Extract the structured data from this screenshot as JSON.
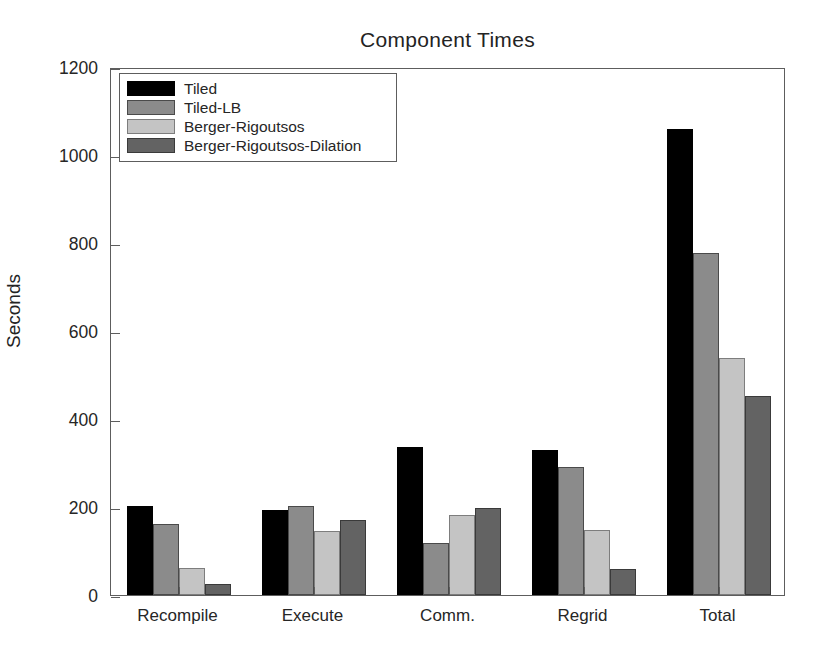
{
  "chart_data": {
    "type": "bar",
    "title": "Component Times",
    "xlabel": "",
    "ylabel": "Seconds",
    "ylim": [
      0,
      1200
    ],
    "yticks": [
      0,
      200,
      400,
      600,
      800,
      1000,
      1200
    ],
    "grid": false,
    "legend_position": "upper left",
    "categories": [
      "Recompile",
      "Execute",
      "Comm.",
      "Regrid",
      "Total"
    ],
    "series": [
      {
        "name": "Tiled",
        "color": "#000000",
        "values": [
          202,
          193,
          336,
          330,
          1058
        ]
      },
      {
        "name": "Tiled-LB",
        "color": "#8b8b8b",
        "values": [
          161,
          203,
          118,
          292,
          777
        ]
      },
      {
        "name": "Berger-Rigoutsos",
        "color": "#c4c4c4",
        "values": [
          62,
          146,
          182,
          148,
          538
        ]
      },
      {
        "name": "Berger-Rigoutsos-Dilation",
        "color": "#636363",
        "values": [
          25,
          170,
          197,
          60,
          452
        ]
      }
    ]
  }
}
